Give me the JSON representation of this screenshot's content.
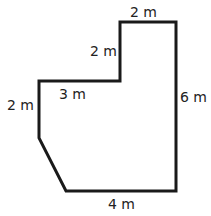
{
  "diagram": {
    "type": "composite-polygon",
    "stroke_color": "#1a1a1a",
    "vertices": [
      [
        120,
        22
      ],
      [
        176,
        22
      ],
      [
        176,
        191
      ],
      [
        66,
        191
      ],
      [
        39,
        138
      ],
      [
        39,
        81
      ],
      [
        120,
        81
      ]
    ],
    "labels": {
      "top": "2 m",
      "upper_left_vertical": "2 m",
      "right": "6 m",
      "middle_horizontal": "3 m",
      "left_vertical": "2 m",
      "bottom": "4 m"
    }
  }
}
